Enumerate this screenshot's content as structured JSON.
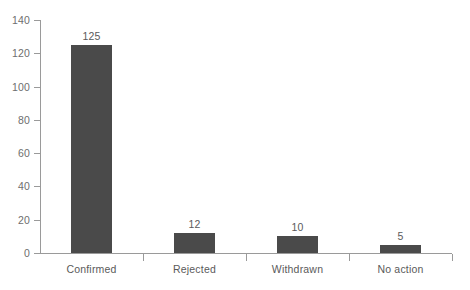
{
  "chart_data": {
    "type": "bar",
    "title": "",
    "subtitle": "",
    "xlabel": "",
    "ylabel": "",
    "categories": [
      "Confirmed",
      "Rejected",
      "Withdrawn",
      "No action"
    ],
    "values": [
      125,
      12,
      10,
      5
    ],
    "value_labels": [
      "125",
      "12",
      "10",
      "5"
    ],
    "ylim": [
      0,
      140
    ],
    "ytick_values": [
      0,
      20,
      40,
      60,
      80,
      100,
      120,
      140
    ],
    "ytick_labels": [
      "0",
      "20",
      "40",
      "60",
      "80",
      "100",
      "120",
      "140"
    ],
    "grid": false,
    "legend": false,
    "legend_position": "none",
    "bar_color": "#4a4a4a",
    "axis_color": "#9a9a9a",
    "text_color": "#5a5a5a",
    "background_color": "#ffffff"
  }
}
